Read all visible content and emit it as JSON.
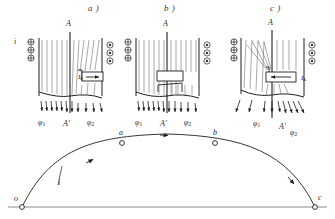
{
  "figure": {
    "kind": "physics-diagram",
    "panels": [
      {
        "id": "a",
        "caption": "a )",
        "axis_top_label": "A",
        "axis_bottom_label": "A'",
        "current_label": "i",
        "flux_left_label": "φ",
        "flux_left_sub": "1",
        "flux_right_label": "φ",
        "flux_right_sub": "2",
        "coil_current_label": "I",
        "coil_current_sub": "к",
        "left_symbol": "cross-in-circle",
        "right_symbol": "dot-in-circle",
        "symbol_count": 3,
        "coil_arrow_direction": "right",
        "coil_position": "right-of-axis"
      },
      {
        "id": "b",
        "caption": "b )",
        "axis_top_label": "A",
        "axis_bottom_label": "A'",
        "flux_left_label": "φ",
        "flux_left_sub": "1",
        "flux_right_label": "φ",
        "flux_right_sub": "2",
        "left_symbol": "cross-in-circle",
        "right_symbol": "dot-in-circle",
        "symbol_count": 3,
        "coil_arrow_direction": "none",
        "coil_position": "centered"
      },
      {
        "id": "c",
        "caption": "c )",
        "axis_top_label": "A",
        "axis_bottom_label": "A'",
        "flux_left_label": "φ",
        "flux_left_sub": "1",
        "flux_right_label": "φ",
        "flux_right_sub": "2",
        "coil_current_label": "I",
        "coil_current_sub": "к",
        "left_symbol": "cross-in-circle",
        "right_symbol": "dot-in-circle",
        "symbol_count": 3,
        "coil_arrow_direction": "left",
        "coil_position": "right-of-axis"
      }
    ],
    "wave": {
      "type": "sine-arc-half-cycle",
      "curve_label": "i",
      "points": [
        {
          "name": "o",
          "label": "o",
          "x_frac": 0.0,
          "y_frac": 0.0
        },
        {
          "name": "a",
          "label": "a",
          "x_frac": 0.35,
          "y_frac": 0.86
        },
        {
          "name": "peak",
          "label": "",
          "x_frac": 0.5,
          "y_frac": 1.0
        },
        {
          "name": "b",
          "label": "b",
          "x_frac": 0.65,
          "y_frac": 0.86
        },
        {
          "name": "c",
          "label": "c",
          "x_frac": 1.0,
          "y_frac": 0.0
        }
      ],
      "baseline": true,
      "arrow_markers": 3
    },
    "colors": {
      "ink": "#1f1f1f",
      "flux_line": "#6f6f6f",
      "baseline": "#8a8a8a",
      "background": "#ffffff"
    }
  }
}
